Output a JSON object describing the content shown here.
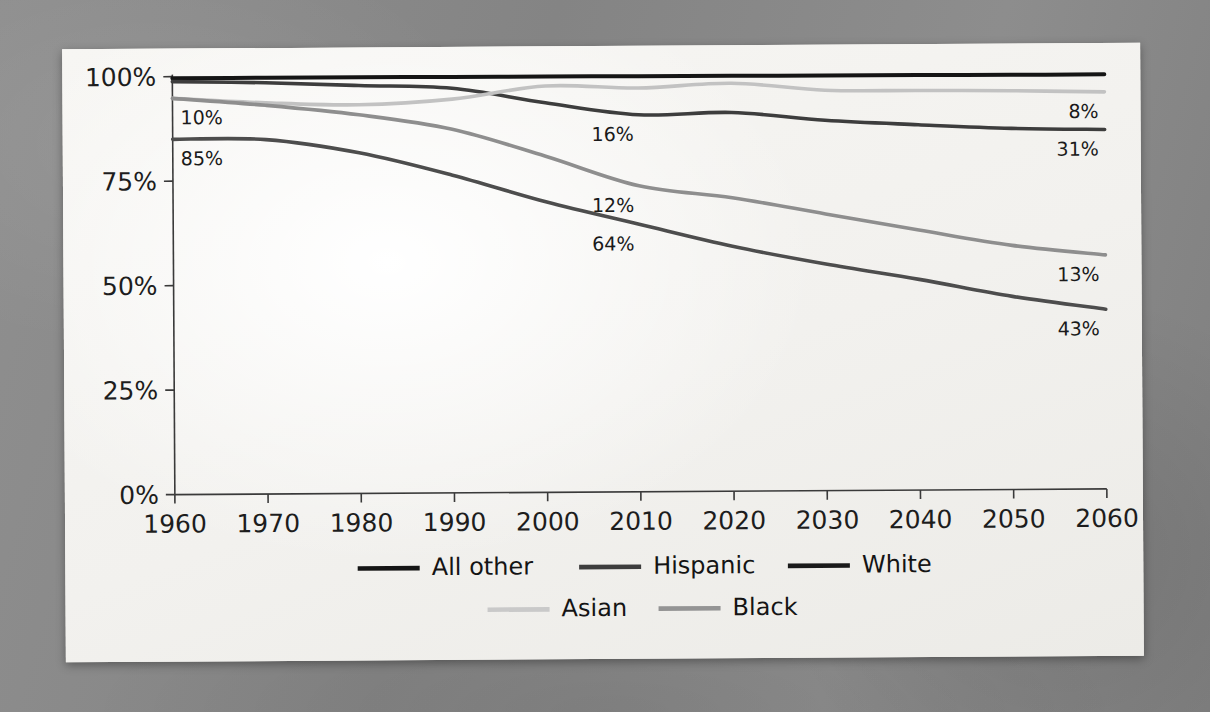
{
  "figure": {
    "background_color": "#8a8a8a",
    "paper_color": "#f4f3f0"
  },
  "chart_data": {
    "type": "line",
    "title": "",
    "subtitle": "",
    "xlabel": "",
    "ylabel": "",
    "x": [
      1960,
      1970,
      1980,
      1990,
      2000,
      2010,
      2020,
      2030,
      2040,
      2050,
      2060
    ],
    "xlim": [
      1960,
      2060
    ],
    "ylim": [
      0,
      100
    ],
    "y_tick_labels": [
      "0%",
      "25%",
      "50%",
      "75%",
      "100%"
    ],
    "y_ticks": [
      0,
      25,
      50,
      75,
      100
    ],
    "x_tick_labels": [
      "1960",
      "1970",
      "1980",
      "1990",
      "2000",
      "2010",
      "2020",
      "2030",
      "2040",
      "2050",
      "2060"
    ],
    "grid": false,
    "legend_position": "bottom",
    "series": [
      {
        "name": "All other",
        "color": "#151515",
        "width": 4.0,
        "values": [
          99.6,
          99.6,
          99.6,
          99.5,
          99.5,
          99.4,
          99.4,
          99.3,
          99.3,
          99.2,
          99.2
        ]
      },
      {
        "name": "Hispanic",
        "color": "#3d3d3d",
        "width": 3.6,
        "values": [
          98.8,
          98.4,
          97.6,
          96.8,
          93.2,
          90.2,
          90.6,
          88.6,
          87.4,
          86.4,
          86.0
        ]
      },
      {
        "name": "White",
        "color": "#4d4d4d",
        "width": 3.6,
        "values": [
          85.0,
          84.8,
          81.5,
          76.0,
          69.5,
          64.0,
          58.6,
          54.2,
          50.4,
          46.2,
          43.0
        ]
      },
      {
        "name": "Asian",
        "color": "#c2c2c2",
        "width": 3.6,
        "values": [
          94.8,
          93.6,
          93.0,
          94.2,
          97.2,
          96.6,
          97.6,
          95.8,
          95.6,
          95.4,
          95.0
        ]
      },
      {
        "name": "Black",
        "color": "#8e8e8e",
        "width": 3.6,
        "values": [
          94.8,
          93.0,
          90.6,
          87.0,
          80.4,
          73.2,
          70.2,
          66.2,
          62.2,
          58.4,
          56.0
        ]
      }
    ],
    "annotations": [
      {
        "text": "10%",
        "x": 1960,
        "y": 94.8,
        "series": "Asian",
        "position": "below-right"
      },
      {
        "text": "85%",
        "x": 1960,
        "y": 85.0,
        "series": "White",
        "position": "below-right"
      },
      {
        "text": "16%",
        "x": 2010,
        "y": 90.2,
        "series": "Hispanic",
        "position": "below"
      },
      {
        "text": "12%",
        "x": 2010,
        "y": 73.2,
        "series": "Black",
        "position": "below"
      },
      {
        "text": "64%",
        "x": 2010,
        "y": 64.0,
        "series": "White",
        "position": "below"
      },
      {
        "text": "8%",
        "x": 2060,
        "y": 95.0,
        "series": "Asian",
        "position": "below-left"
      },
      {
        "text": "31%",
        "x": 2060,
        "y": 86.0,
        "series": "Hispanic",
        "position": "below-left"
      },
      {
        "text": "13%",
        "x": 2060,
        "y": 56.0,
        "series": "Black",
        "position": "below-left"
      },
      {
        "text": "43%",
        "x": 2060,
        "y": 43.0,
        "series": "White",
        "position": "below-left"
      }
    ],
    "legend": [
      {
        "label": "All other",
        "color": "#151515"
      },
      {
        "label": "Hispanic",
        "color": "#3d3d3d"
      },
      {
        "label": "White",
        "color": "#1a1a1a"
      },
      {
        "label": "Asian",
        "color": "#c9c9c9"
      },
      {
        "label": "Black",
        "color": "#949494"
      }
    ]
  }
}
